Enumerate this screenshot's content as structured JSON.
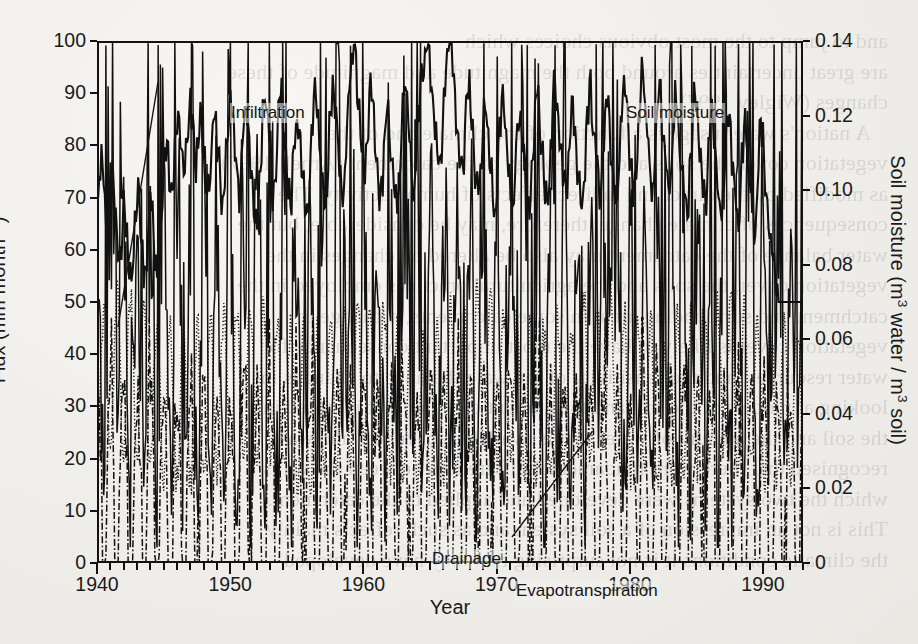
{
  "figure": {
    "kind": "scanned-journal-figure",
    "background_note": "faint mirrored bleed-through text from reverse page",
    "bleed_text": "and to jump to the most obvious choices which\nare great uncertainties around both the magnitude and magnitude of these\nchanges (Wigley 1997).\n   A nation's water usage is a function of the climate and of the\nvegetation cover, the soils and the geology of the catchment (Arnell 1997)\nas modified by the direct and indirect effects of human activity. The\nconsequences of climate change, therefore, may be considerable, but the\nwater balance of the catchment may also be altered by changes in the\nvegetation cover, the soils and the agricultural practices employed in the\ncatchment and surrounding area. In some catchments, a change in\nvegetation cover is likely to have the most important consequence for\nwater resources, and the sensitivity of the water balance to changes in\nlooking at models of the soil and the amount of water that is stored in\nthe soil and the amount of water that is available for runoff and was\nrecognised that there were fundamental differences between the ways\nwhich the two systems were developed and applied to the catchment.\nThis is not an impression of a soil system and as such reflects mainly\nthe climatic conditions it is not surprising that they have developed\n"
  },
  "chart_data": {
    "type": "line",
    "title": "",
    "xlabel": "Year",
    "ylabel_left": "Flux (mm month−1)",
    "ylabel_right": "Soil moisture (m3 water / m3 soil)",
    "ylabel_left_parts": {
      "text": "Flux (mm month",
      "sup": "−1",
      "tail": ")"
    },
    "ylabel_right_parts": {
      "a": "Soil moisture (m",
      "sup1": "3",
      "b": " water / m",
      "sup2": "3",
      "c": " soil)"
    },
    "xlim": [
      1940,
      1993
    ],
    "xticks_major": [
      1940,
      1950,
      1960,
      1970,
      1980,
      1990
    ],
    "xticks_minor_step": 1,
    "ylim_left": [
      0,
      100
    ],
    "yticks_left": [
      0,
      10,
      20,
      30,
      40,
      50,
      60,
      70,
      80,
      90,
      100
    ],
    "ylim_right": [
      0,
      0.14
    ],
    "yticks_right": [
      "0",
      "0.02",
      "0.04",
      "0.06",
      "0.08",
      "0.10",
      "0.12",
      "0.14"
    ],
    "yticks_right_values": [
      0,
      0.02,
      0.04,
      0.06,
      0.08,
      0.1,
      0.12,
      0.14
    ],
    "grid": false,
    "legend_position": "inline-annotations",
    "series": [
      {
        "name": "Soil moisture",
        "axis": "right",
        "style": "solid",
        "annotation_label": "Soil moisture",
        "units": "m3 water / m3 soil",
        "monthly_values_left_scale": [
          72,
          70,
          76,
          78,
          74,
          70,
          66,
          62,
          64,
          70,
          73,
          72,
          68,
          64,
          62,
          58,
          60,
          66,
          70,
          68,
          63,
          58,
          55,
          53,
          58,
          64,
          69,
          72,
          70,
          65,
          60,
          57,
          55,
          58,
          63,
          68,
          70,
          66,
          61,
          57,
          55,
          57,
          62,
          68,
          74,
          79,
          82,
          80,
          76,
          72,
          69,
          72,
          78,
          84,
          88,
          86,
          82,
          78,
          74,
          76,
          80,
          86,
          89,
          87,
          83,
          79,
          76,
          79,
          84,
          88,
          85,
          80,
          75,
          72,
          70,
          73,
          78,
          83,
          86,
          84,
          80,
          76,
          73,
          70,
          68,
          72,
          78,
          84,
          88,
          90,
          87,
          83,
          79,
          75,
          72,
          70,
          74,
          80,
          85,
          88,
          86,
          82,
          78,
          74,
          70,
          67,
          64,
          66,
          72,
          78,
          84,
          89,
          91,
          88,
          84,
          80,
          76,
          72,
          70,
          74,
          80,
          86,
          90,
          88,
          84,
          80,
          76,
          73,
          70,
          68,
          72,
          78,
          83,
          86,
          84,
          80,
          76,
          73,
          70,
          68,
          66,
          70,
          76,
          82,
          87,
          90,
          88,
          84,
          80,
          77,
          74,
          71,
          69,
          72,
          78,
          84,
          89,
          92,
          90,
          86,
          82,
          78,
          75,
          72,
          70,
          74,
          80,
          86,
          91,
          95,
          97,
          99,
          97,
          93,
          88,
          83,
          79,
          76,
          73,
          76,
          82,
          87,
          91,
          89,
          85,
          81,
          77,
          74,
          71,
          69,
          72,
          78,
          84,
          88,
          86,
          82,
          78,
          75,
          72,
          70,
          68,
          71,
          77,
          83,
          88,
          91,
          89,
          85,
          81,
          77,
          74,
          71,
          74,
          80,
          86,
          90,
          93,
          95,
          97,
          99,
          100,
          98,
          94,
          90,
          86,
          82,
          79,
          76,
          74,
          78,
          84,
          89,
          93,
          96,
          98,
          100,
          99,
          95,
          91,
          87,
          83,
          79,
          76,
          73,
          76,
          82,
          88,
          92,
          90,
          86,
          82,
          78,
          75,
          72,
          70,
          73,
          79,
          85,
          89,
          87,
          83,
          79,
          76,
          73,
          70,
          68,
          71,
          77,
          83,
          87,
          90,
          88,
          84,
          80,
          76,
          73,
          70,
          68,
          72,
          78,
          84,
          88,
          86,
          82,
          78,
          75,
          72,
          69,
          67,
          70,
          76,
          82,
          87,
          90,
          88,
          84,
          80,
          77,
          74,
          71,
          69,
          73,
          79,
          85,
          89,
          92,
          90,
          86,
          82,
          78,
          75,
          72,
          70,
          73,
          79,
          85,
          89,
          87,
          83,
          79,
          76,
          73,
          70,
          68,
          71,
          77,
          83,
          88,
          91,
          89,
          85,
          81,
          78,
          75,
          72,
          70,
          74,
          80,
          86,
          90,
          88,
          84,
          80,
          76,
          73,
          70,
          68,
          72,
          78,
          84,
          88,
          91,
          89,
          85,
          81,
          78,
          75,
          72,
          70,
          74,
          80,
          86,
          91,
          94,
          92,
          88,
          84,
          80,
          77,
          74,
          71,
          75,
          81,
          87,
          91,
          89,
          85,
          81,
          78,
          75,
          72,
          70,
          73,
          79,
          85,
          89,
          87,
          83,
          79,
          76,
          73,
          70,
          68,
          66,
          70,
          76,
          82,
          87,
          90,
          88,
          84,
          80,
          76,
          73,
          70,
          68,
          72,
          78,
          84,
          88,
          86,
          82,
          78,
          74,
          71,
          68,
          66,
          70,
          76,
          82,
          86,
          84,
          80,
          76,
          73,
          70,
          67,
          65,
          69,
          75,
          81,
          85,
          83,
          79,
          75,
          72,
          69,
          66,
          64,
          68,
          74,
          80,
          84,
          82,
          78,
          74,
          70,
          67,
          64,
          62,
          58,
          55,
          52,
          50,
          48,
          46,
          44,
          42,
          40,
          38,
          36,
          34,
          32,
          30,
          28,
          27,
          26,
          25,
          24,
          23,
          22
        ]
      },
      {
        "name": "Infiltration",
        "axis": "left",
        "style": "solid",
        "annotation_label": "Infiltration",
        "typical_range": [
          5,
          100
        ],
        "description": "highly spiky monthly infiltration, frequent peaks 50-100 mm, troughs near 5-20 mm"
      },
      {
        "name": "Evapotranspiration",
        "axis": "left",
        "style": "dotted",
        "annotation_label": "Evapotranspiration",
        "typical_range": [
          15,
          55
        ],
        "description": "dotted curve oscillating seasonally between about 15 and 55 mm month-1"
      },
      {
        "name": "Drainage",
        "axis": "left",
        "style": "dash-dot",
        "annotation_label": "Drainage",
        "typical_range": [
          0,
          45
        ],
        "description": "dash-dot curve, strong seasonality, frequently falling to near 0 mm month-1 in summers"
      }
    ]
  }
}
